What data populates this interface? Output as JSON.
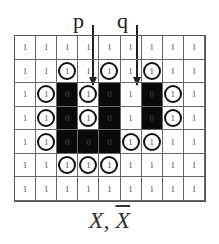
{
  "labels": {
    "p": "p",
    "q": "q"
  },
  "caption": {
    "x": "X",
    "sep": ", ",
    "xbar": "X"
  },
  "grid": {
    "rows": 7,
    "cols": 9,
    "cells": [
      [
        {
          "v": "1",
          "c": false
        },
        {
          "v": "1",
          "c": false
        },
        {
          "v": "1",
          "c": false
        },
        {
          "v": "1",
          "c": false
        },
        {
          "v": "1",
          "c": false
        },
        {
          "v": "1",
          "c": false
        },
        {
          "v": "1",
          "c": false
        },
        {
          "v": "1",
          "c": false
        },
        {
          "v": "1",
          "c": false
        }
      ],
      [
        {
          "v": "1",
          "c": false
        },
        {
          "v": "1",
          "c": false
        },
        {
          "v": "1",
          "c": true
        },
        {
          "v": "1",
          "c": false
        },
        {
          "v": "1",
          "c": true
        },
        {
          "v": "1",
          "c": false
        },
        {
          "v": "1",
          "c": true
        },
        {
          "v": "1",
          "c": false
        },
        {
          "v": "1",
          "c": false
        }
      ],
      [
        {
          "v": "1",
          "c": false
        },
        {
          "v": "1",
          "c": true
        },
        {
          "v": "0",
          "c": false
        },
        {
          "v": "1",
          "c": true
        },
        {
          "v": "0",
          "c": false
        },
        {
          "v": "1",
          "c": false
        },
        {
          "v": "0",
          "c": false
        },
        {
          "v": "1",
          "c": true
        },
        {
          "v": "1",
          "c": false
        }
      ],
      [
        {
          "v": "1",
          "c": false
        },
        {
          "v": "1",
          "c": true
        },
        {
          "v": "0",
          "c": false
        },
        {
          "v": "1",
          "c": true
        },
        {
          "v": "0",
          "c": false
        },
        {
          "v": "1",
          "c": false
        },
        {
          "v": "0",
          "c": false
        },
        {
          "v": "1",
          "c": true
        },
        {
          "v": "1",
          "c": false
        }
      ],
      [
        {
          "v": "1",
          "c": false
        },
        {
          "v": "1",
          "c": true
        },
        {
          "v": "0",
          "c": false
        },
        {
          "v": "0",
          "c": false
        },
        {
          "v": "0",
          "c": false
        },
        {
          "v": "1",
          "c": true
        },
        {
          "v": "1",
          "c": true
        },
        {
          "v": "1",
          "c": false
        },
        {
          "v": "1",
          "c": false
        }
      ],
      [
        {
          "v": "1",
          "c": false
        },
        {
          "v": "1",
          "c": false
        },
        {
          "v": "1",
          "c": true
        },
        {
          "v": "1",
          "c": true
        },
        {
          "v": "1",
          "c": true
        },
        {
          "v": "1",
          "c": false
        },
        {
          "v": "1",
          "c": false
        },
        {
          "v": "1",
          "c": false
        },
        {
          "v": "1",
          "c": false
        }
      ],
      [
        {
          "v": "1",
          "c": false
        },
        {
          "v": "1",
          "c": false
        },
        {
          "v": "1",
          "c": false
        },
        {
          "v": "1",
          "c": false
        },
        {
          "v": "1",
          "c": false
        },
        {
          "v": "1",
          "c": false
        },
        {
          "v": "1",
          "c": false
        },
        {
          "v": "1",
          "c": false
        },
        {
          "v": "1",
          "c": false
        }
      ]
    ]
  },
  "colors": {
    "zero_fill": "#0a0a0a",
    "ring": "#111111",
    "grid_line": "#666666"
  }
}
